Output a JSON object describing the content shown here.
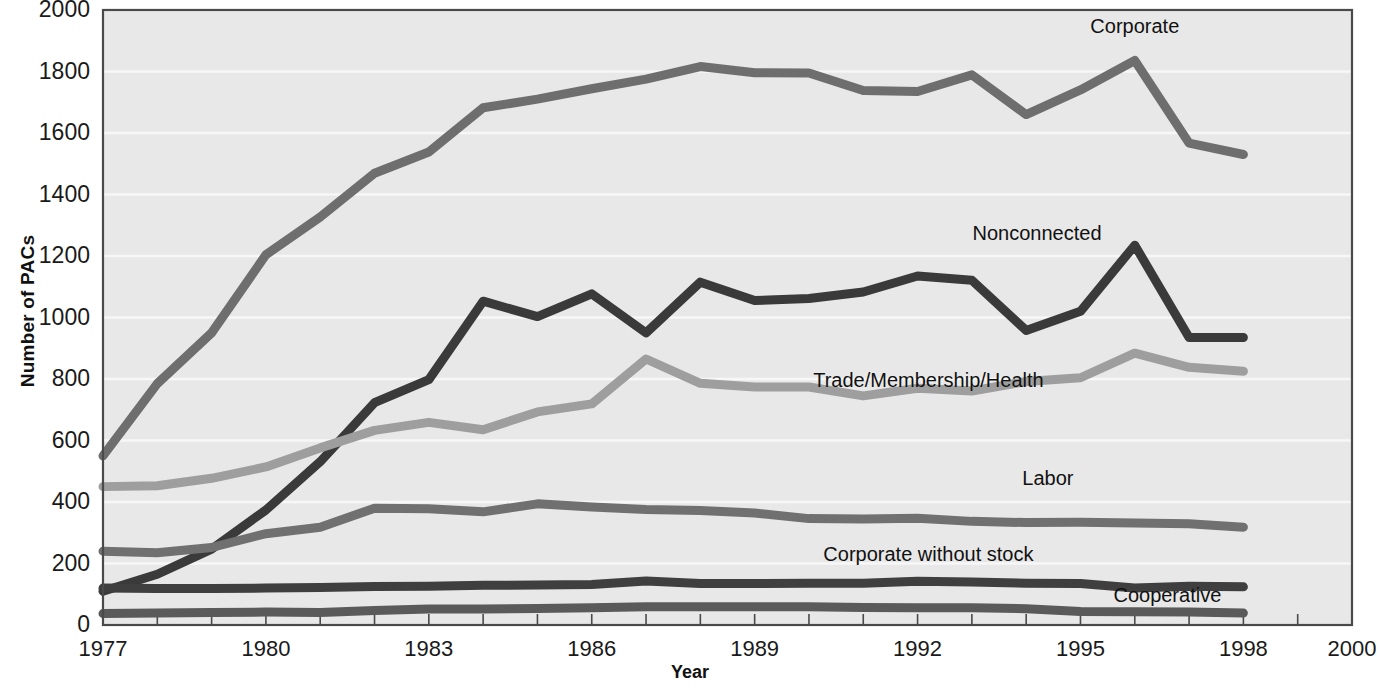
{
  "chart_data": {
    "type": "line",
    "title": "",
    "xlabel": "Year",
    "ylabel": "Number of PACs",
    "xlim": [
      1977,
      2000
    ],
    "ylim": [
      0,
      2000
    ],
    "grid": true,
    "legend_position": "inline-right-of-lines",
    "x": [
      1977,
      1978,
      1979,
      1980,
      1981,
      1982,
      1983,
      1984,
      1985,
      1986,
      1987,
      1988,
      1989,
      1990,
      1991,
      1992,
      1993,
      1994,
      1995,
      1996,
      1997,
      1998
    ],
    "xticks": [
      1977,
      1980,
      1983,
      1986,
      1989,
      1992,
      1995,
      1998,
      2000
    ],
    "yticks": [
      0,
      200,
      400,
      600,
      800,
      1000,
      1200,
      1400,
      1600,
      1800,
      2000
    ],
    "series": [
      {
        "name": "Corporate",
        "color": "#6e6e6e",
        "label_x": 1996.0,
        "label_y": 1940,
        "values": [
          550,
          785,
          950,
          1204,
          1327,
          1469,
          1538,
          1682,
          1710,
          1744,
          1775,
          1816,
          1796,
          1795,
          1738,
          1735,
          1789,
          1660,
          1740,
          1836,
          1567,
          1530
        ]
      },
      {
        "name": "Nonconnected",
        "color": "#3a3a3a",
        "label_x": 1994.2,
        "label_y": 1268,
        "values": [
          110,
          165,
          247,
          374,
          531,
          723,
          798,
          1053,
          1003,
          1077,
          950,
          1115,
          1055,
          1062,
          1083,
          1135,
          1121,
          958,
          1020,
          1235,
          935,
          935
        ]
      },
      {
        "name": "Trade/Membership/Health",
        "color": "#9e9e9e",
        "label_x": 1992.2,
        "label_y": 790,
        "values": [
          450,
          453,
          477,
          514,
          576,
          633,
          659,
          635,
          693,
          719,
          865,
          786,
          774,
          774,
          745,
          770,
          761,
          792,
          804,
          884,
          838,
          825
        ]
      },
      {
        "name": "Labor",
        "color": "#707070",
        "label_x": 1994.4,
        "label_y": 470,
        "values": [
          240,
          235,
          252,
          297,
          318,
          380,
          378,
          368,
          394,
          384,
          376,
          372,
          364,
          346,
          345,
          347,
          337,
          333,
          334,
          332,
          329,
          318
        ]
      },
      {
        "name": "Corporate without stock",
        "color": "#3f3f3f",
        "label_x": 1992.2,
        "label_y": 225,
        "values": [
          120,
          119,
          119,
          120,
          122,
          125,
          126,
          129,
          130,
          132,
          143,
          135,
          135,
          136,
          136,
          142,
          140,
          136,
          135,
          120,
          126,
          124
        ]
      },
      {
        "name": "Cooperative",
        "color": "#5a5a5a",
        "label_x": 1996.6,
        "label_y": 90,
        "values": [
          37,
          39,
          41,
          42,
          41,
          47,
          52,
          52,
          54,
          56,
          59,
          59,
          59,
          59,
          57,
          56,
          56,
          53,
          44,
          43,
          42,
          39
        ]
      }
    ]
  },
  "axes": {
    "y_title": "Number of PACs",
    "x_title": "Year",
    "y_tick_labels": [
      "0",
      "200",
      "400",
      "600",
      "800",
      "1000",
      "1200",
      "1400",
      "1600",
      "1800",
      "2000"
    ],
    "x_tick_labels": [
      "1977",
      "1980",
      "1983",
      "1986",
      "1989",
      "1992",
      "1995",
      "1998",
      "2000"
    ]
  },
  "style": {
    "plot_background": "#e8e8e8",
    "grid_color": "#f7f7f7",
    "frame_color": "#4a4a4a"
  }
}
